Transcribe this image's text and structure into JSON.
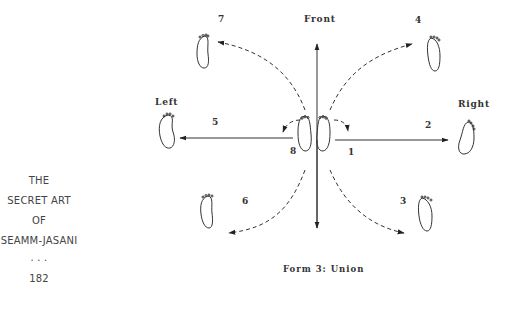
{
  "sidebar": {
    "title_lines": [
      "THE",
      "SECRET ART",
      "OF",
      "SEAMM-JASANI"
    ],
    "separator": ". . .",
    "page_number": "182"
  },
  "diagram": {
    "directions": {
      "front": "Front",
      "left": "Left",
      "right": "Right"
    },
    "step_numbers": {
      "s1": "1",
      "s2": "2",
      "s3": "3",
      "s4": "4",
      "s5": "5",
      "s6": "6",
      "s7": "7",
      "s8": "8"
    },
    "caption": "Form 3: Union"
  }
}
